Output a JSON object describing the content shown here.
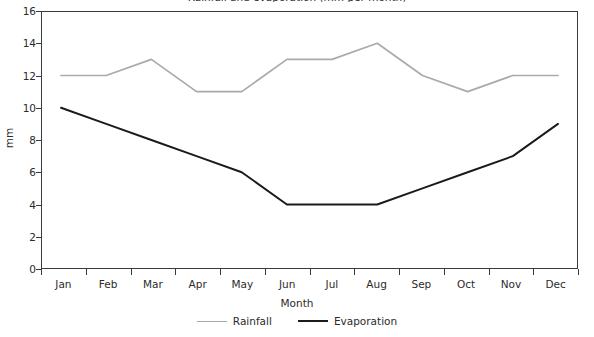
{
  "chart_data": {
    "type": "line",
    "title": "Rainfall and evaporation (mm per month)",
    "xlabel": "Month",
    "ylabel": "mm",
    "categories": [
      "Jan",
      "Feb",
      "Mar",
      "Apr",
      "May",
      "Jun",
      "Jul",
      "Aug",
      "Sep",
      "Oct",
      "Nov",
      "Dec"
    ],
    "ylim": [
      0,
      16
    ],
    "yticks": [
      0,
      2,
      4,
      6,
      8,
      10,
      12,
      14,
      16
    ],
    "grid": false,
    "legend_position": "bottom",
    "series": [
      {
        "name": "Rainfall",
        "color": "#aaaaaa",
        "values": [
          12,
          12,
          13,
          11,
          11,
          13,
          13,
          14,
          12,
          11,
          12,
          12
        ]
      },
      {
        "name": "Evaporation",
        "color": "#1a1a1a",
        "values": [
          10,
          9,
          8,
          7,
          6,
          4,
          4,
          4,
          5,
          6,
          7,
          9
        ]
      }
    ]
  },
  "legend": {
    "items": [
      {
        "label": "Rainfall"
      },
      {
        "label": "Evaporation"
      }
    ]
  }
}
